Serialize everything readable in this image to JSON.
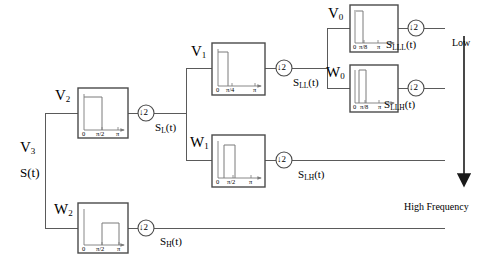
{
  "diagram": {
    "input": {
      "space_label": "V3",
      "space_label_sub": "3",
      "space_label_base": "V",
      "signal_label": "S(t)"
    },
    "vertical_axis": {
      "top_label": "Low",
      "bottom_label": "High Frequency",
      "arrow": "down-arrow"
    },
    "downsampler": {
      "symbol": "↓2",
      "arrow": "↓",
      "factor": "2"
    },
    "stages": [
      {
        "id": "v2",
        "space_label_base": "V",
        "space_label_sub": "2",
        "filter_type": "lowpass",
        "axis_ticks": [
          "0",
          "π/2",
          "π"
        ],
        "band_start": 0.0,
        "band_end": 0.5,
        "band_height": 0.82,
        "output_label_base": "S",
        "output_label_sub": "L",
        "output_label_suffix": "(t)"
      },
      {
        "id": "w2",
        "space_label_base": "W",
        "space_label_sub": "2",
        "filter_type": "highpass",
        "axis_ticks": [
          "0",
          "π/2",
          "π"
        ],
        "band_start": 0.5,
        "band_end": 1.0,
        "band_height": 0.56,
        "output_label_base": "S",
        "output_label_sub": "H",
        "output_label_suffix": "(t)"
      },
      {
        "id": "v1",
        "space_label_base": "V",
        "space_label_sub": "1",
        "filter_type": "lowpass",
        "axis_ticks": [
          "0",
          "π/4",
          "π"
        ],
        "band_start": 0.0,
        "band_end": 0.25,
        "band_height": 0.72,
        "output_label_base": "S",
        "output_label_sub": "LL",
        "output_label_suffix": "(t)"
      },
      {
        "id": "w1",
        "space_label_base": "W",
        "space_label_sub": "1",
        "filter_type": "bandpass",
        "axis_ticks": [
          "0",
          "π/2",
          "π"
        ],
        "band_start": 0.22,
        "band_end": 0.5,
        "band_height": 0.7,
        "output_label_base": "S",
        "output_label_sub": "LH",
        "output_label_suffix": "(t)"
      },
      {
        "id": "v0",
        "space_label_base": "V",
        "space_label_sub": "0",
        "filter_type": "lowpass",
        "axis_ticks": [
          "0",
          "π/8",
          "π"
        ],
        "band_start": 0.0,
        "band_end": 0.13,
        "band_height": 0.86,
        "output_label_base": "S",
        "output_label_sub": "LLL",
        "output_label_suffix": "(t)"
      },
      {
        "id": "w0",
        "space_label_base": "W",
        "space_label_sub": "0",
        "filter_type": "bandpass",
        "axis_ticks": [
          "0",
          "π/8",
          "π"
        ],
        "band_start": 0.11,
        "band_end": 0.24,
        "band_height": 0.84,
        "output_label_base": "S",
        "output_label_sub": "LLH",
        "output_label_suffix": "(t)"
      }
    ],
    "colors": {
      "line": "#555555",
      "box_border": "#4a4a4a",
      "plot_stroke": "#7a7a7a",
      "text": "#000000",
      "background": "#ffffff"
    }
  }
}
